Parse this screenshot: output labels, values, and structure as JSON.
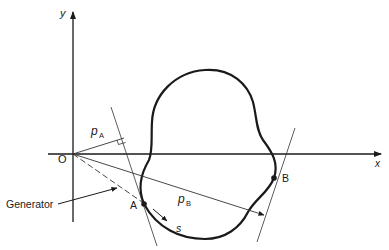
{
  "figure": {
    "type": "geometric-diagram"
  },
  "axes": {
    "x_label": "x",
    "y_label": "y",
    "origin_label": "O"
  },
  "points": {
    "A": {
      "label": "A"
    },
    "B": {
      "label": "B"
    }
  },
  "distances": {
    "pA": {
      "symbol": "p",
      "subscript": "A"
    },
    "pB": {
      "symbol": "p",
      "subscript": "B"
    }
  },
  "arc_length": {
    "label": "s"
  },
  "annotations": {
    "generator": "Generator"
  },
  "colors": {
    "ink": "#1a1a1a",
    "thin_line": "#333333",
    "background": "#ffffff"
  }
}
